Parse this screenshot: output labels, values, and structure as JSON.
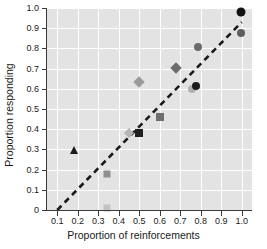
{
  "chart_data": {
    "type": "scatter",
    "title": "",
    "xlabel": "Proportion of reinforcements",
    "ylabel": "Proportion responding",
    "xlim": [
      0.05,
      1.05
    ],
    "ylim": [
      0.0,
      1.0
    ],
    "xticks": [
      "0.1",
      "0.2",
      "0.3",
      "0.4",
      "0.5",
      "0.6",
      "0.7",
      "0.8",
      "0.9",
      "1.0"
    ],
    "xtick_values": [
      0.1,
      0.2,
      0.3,
      0.4,
      0.5,
      0.6,
      0.7,
      0.8,
      0.9,
      1.0
    ],
    "yticks": [
      "0",
      "0.1",
      "0.2",
      "0.3",
      "0.4",
      "0.5",
      "0.6",
      "0.7",
      "0.8",
      "0.9",
      "1.0"
    ],
    "ytick_values": [
      0,
      0.1,
      0.2,
      0.3,
      0.4,
      0.5,
      0.6,
      0.7,
      0.8,
      0.9,
      1.0
    ],
    "grid": true,
    "grid_color": "#ffffff",
    "plot_background": "#e3e3e3",
    "legend": null,
    "reference_line": {
      "style": "dashed",
      "color": "#1a1a1a",
      "x_start": 0.1,
      "y_start": 0.0,
      "x_end": 1.0,
      "y_end": 0.93
    },
    "points": [
      {
        "x": 0.18,
        "y": 0.275,
        "marker": "triangle",
        "color": "#1a1a1a",
        "size": 8
      },
      {
        "x": 0.34,
        "y": 0.012,
        "marker": "square",
        "color": "#c2c2c2",
        "size": 7
      },
      {
        "x": 0.34,
        "y": 0.178,
        "marker": "square",
        "color": "#8f8f8f",
        "size": 7
      },
      {
        "x": 0.45,
        "y": 0.382,
        "marker": "diamond",
        "color": "#b5b5b5",
        "size": 7
      },
      {
        "x": 0.5,
        "y": 0.383,
        "marker": "square",
        "color": "#1f1f1f",
        "size": 8
      },
      {
        "x": 0.5,
        "y": 0.635,
        "marker": "diamond",
        "color": "#9a9a9a",
        "size": 8
      },
      {
        "x": 0.6,
        "y": 0.46,
        "marker": "square",
        "color": "#6e6e6e",
        "size": 8
      },
      {
        "x": 0.68,
        "y": 0.702,
        "marker": "diamond",
        "color": "#6b6b6b",
        "size": 8
      },
      {
        "x": 0.755,
        "y": 0.598,
        "marker": "circle",
        "color": "#b0b0b0",
        "size": 8
      },
      {
        "x": 0.775,
        "y": 0.613,
        "marker": "circle",
        "color": "#1a1a1a",
        "size": 8
      },
      {
        "x": 0.785,
        "y": 0.805,
        "marker": "circle",
        "color": "#6b6b6b",
        "size": 8
      },
      {
        "x": 0.995,
        "y": 0.877,
        "marker": "circle",
        "color": "#5e5e5e",
        "size": 8
      },
      {
        "x": 0.995,
        "y": 0.978,
        "marker": "circle",
        "color": "#111111",
        "size": 9
      }
    ]
  }
}
